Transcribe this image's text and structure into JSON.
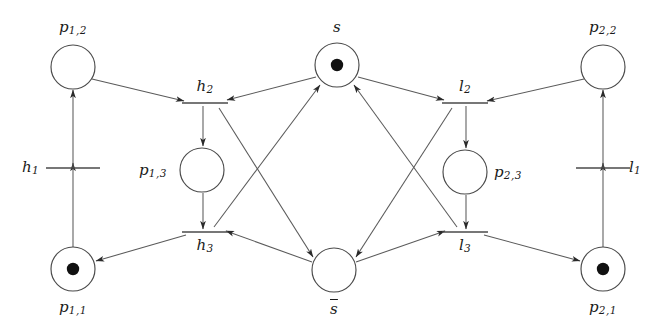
{
  "figure": {
    "kind": "petri-net",
    "width": 656,
    "height": 333,
    "background_color": "#ffffff",
    "stroke_color": "#4a4a4a",
    "arc_color": "#5a5a5a",
    "token_color": "#111111"
  },
  "places": [
    {
      "id": "p12",
      "name": "p",
      "subscript": "1,2",
      "label": "p1,2",
      "cx": 73,
      "cy": 67,
      "r": 22,
      "tokens": 0,
      "label_x": 73,
      "label_y": 20,
      "label_anchor": "center",
      "overline": false
    },
    {
      "id": "p11",
      "name": "p",
      "subscript": "1,1",
      "label": "p1,1",
      "cx": 73,
      "cy": 269,
      "r": 22,
      "tokens": 1,
      "label_x": 73,
      "label_y": 300,
      "label_anchor": "center",
      "overline": false
    },
    {
      "id": "p13",
      "name": "p",
      "subscript": "1,3",
      "label": "p1,3",
      "cx": 202,
      "cy": 170,
      "r": 22,
      "tokens": 0,
      "label_x": 139,
      "label_y": 163,
      "label_anchor": "left",
      "overline": false
    },
    {
      "id": "s",
      "name": "s",
      "subscript": "",
      "label": "s",
      "cx": 337,
      "cy": 65,
      "r": 22,
      "tokens": 1,
      "label_x": 337,
      "label_y": 20,
      "label_anchor": "center",
      "overline": false
    },
    {
      "id": "sbar",
      "name": "s",
      "subscript": "",
      "label": "s-bar",
      "cx": 334,
      "cy": 270,
      "r": 22,
      "tokens": 0,
      "label_x": 334,
      "label_y": 301,
      "label_anchor": "center",
      "overline": true
    },
    {
      "id": "p23",
      "name": "p",
      "subscript": "2,3",
      "label": "p2,3",
      "cx": 465,
      "cy": 172,
      "r": 22,
      "tokens": 0,
      "label_x": 494,
      "label_y": 165,
      "label_anchor": "left",
      "overline": false
    },
    {
      "id": "p22",
      "name": "p",
      "subscript": "2,2",
      "label": "p2,2",
      "cx": 603,
      "cy": 67,
      "r": 22,
      "tokens": 0,
      "label_x": 603,
      "label_y": 20,
      "label_anchor": "center",
      "overline": false
    },
    {
      "id": "p21",
      "name": "p",
      "subscript": "2,1",
      "label": "p2,1",
      "cx": 603,
      "cy": 269,
      "r": 22,
      "tokens": 1,
      "label_x": 603,
      "label_y": 300,
      "label_anchor": "center",
      "overline": false
    }
  ],
  "transitions": [
    {
      "id": "h1",
      "name": "h",
      "subscript": "1",
      "label": "h1",
      "cx": 73,
      "cy": 168,
      "half_width": 27,
      "label_x": 22,
      "label_y": 160,
      "label_anchor": "left"
    },
    {
      "id": "h2",
      "name": "h",
      "subscript": "2",
      "label": "h2",
      "cx": 205,
      "cy": 103,
      "half_width": 23,
      "label_x": 205,
      "label_y": 79,
      "label_anchor": "center"
    },
    {
      "id": "h3",
      "name": "h",
      "subscript": "3",
      "label": "h3",
      "cx": 205,
      "cy": 232,
      "half_width": 23,
      "label_x": 205,
      "label_y": 238,
      "label_anchor": "center"
    },
    {
      "id": "l2",
      "name": "l",
      "subscript": "2",
      "label": "l2",
      "cx": 465,
      "cy": 103,
      "half_width": 23,
      "label_x": 465,
      "label_y": 79,
      "label_anchor": "center"
    },
    {
      "id": "l3",
      "name": "l",
      "subscript": "3",
      "label": "l3",
      "cx": 465,
      "cy": 232,
      "half_width": 23,
      "label_x": 465,
      "label_y": 238,
      "label_anchor": "center"
    },
    {
      "id": "l1",
      "name": "l",
      "subscript": "1",
      "label": "l1",
      "cx": 603,
      "cy": 168,
      "half_width": 27,
      "label_x": 629,
      "label_y": 160,
      "label_anchor": "left"
    }
  ],
  "arcs": [
    {
      "id": "a1",
      "from": "p11",
      "to": "h1",
      "from_label": "p1,1",
      "to_label": "h1",
      "x1": 73,
      "y1": 247,
      "x2": 73,
      "y2": 163
    },
    {
      "id": "a2",
      "from": "h1",
      "to": "p12",
      "from_label": "h1",
      "to_label": "p1,2",
      "x1": 73,
      "y1": 168,
      "x2": 73,
      "y2": 90
    },
    {
      "id": "a3",
      "from": "p12",
      "to": "h2",
      "from_label": "p1,2",
      "to_label": "h2",
      "x1": 92,
      "y1": 79,
      "x2": 184,
      "y2": 101
    },
    {
      "id": "a4",
      "from": "h2",
      "to": "p13",
      "from_label": "h2",
      "to_label": "p1,3",
      "x1": 203,
      "y1": 106,
      "x2": 203,
      "y2": 146
    },
    {
      "id": "a5",
      "from": "p13",
      "to": "h3",
      "from_label": "p1,3",
      "to_label": "h3",
      "x1": 203,
      "y1": 193,
      "x2": 203,
      "y2": 229
    },
    {
      "id": "a6",
      "from": "h3",
      "to": "p11",
      "from_label": "h3",
      "to_label": "p1,1",
      "x1": 186,
      "y1": 235,
      "x2": 96,
      "y2": 261
    },
    {
      "id": "a7",
      "from": "s",
      "to": "h2",
      "from_label": "s",
      "to_label": "h2",
      "x1": 316,
      "y1": 77,
      "x2": 227,
      "y2": 100
    },
    {
      "id": "a8",
      "from": "h2",
      "to": "sbar",
      "from_label": "h2",
      "to_label": "s-bar",
      "x1": 219,
      "y1": 108,
      "x2": 313,
      "y2": 257
    },
    {
      "id": "a9",
      "from": "sbar",
      "to": "h3",
      "from_label": "s-bar",
      "to_label": "h3",
      "x1": 312,
      "y1": 262,
      "x2": 226,
      "y2": 231
    },
    {
      "id": "a10",
      "from": "h3",
      "to": "s",
      "from_label": "h3",
      "to_label": "s",
      "x1": 214,
      "y1": 227,
      "x2": 320,
      "y2": 85
    },
    {
      "id": "a11",
      "from": "p22",
      "to": "l2",
      "from_label": "p2,2",
      "to_label": "l2",
      "x1": 584,
      "y1": 79,
      "x2": 487,
      "y2": 101
    },
    {
      "id": "a12",
      "from": "l2",
      "to": "p23",
      "from_label": "l2",
      "to_label": "p2,3",
      "x1": 466,
      "y1": 106,
      "x2": 466,
      "y2": 148
    },
    {
      "id": "a13",
      "from": "p23",
      "to": "l3",
      "from_label": "p2,3",
      "to_label": "l3",
      "x1": 466,
      "y1": 195,
      "x2": 466,
      "y2": 229
    },
    {
      "id": "a14",
      "from": "l3",
      "to": "p21",
      "from_label": "l3",
      "to_label": "p2,1",
      "x1": 484,
      "y1": 235,
      "x2": 580,
      "y2": 261
    },
    {
      "id": "a15",
      "from": "s",
      "to": "l2",
      "from_label": "s",
      "to_label": "l2",
      "x1": 358,
      "y1": 77,
      "x2": 444,
      "y2": 100
    },
    {
      "id": "a16",
      "from": "l2",
      "to": "sbar",
      "from_label": "l2",
      "to_label": "s-bar",
      "x1": 452,
      "y1": 108,
      "x2": 356,
      "y2": 257
    },
    {
      "id": "a17",
      "from": "sbar",
      "to": "l3",
      "from_label": "s-bar",
      "to_label": "l3",
      "x1": 356,
      "y1": 262,
      "x2": 445,
      "y2": 231
    },
    {
      "id": "a18",
      "from": "l3",
      "to": "s",
      "from_label": "l3",
      "to_label": "s",
      "x1": 457,
      "y1": 227,
      "x2": 354,
      "y2": 85
    },
    {
      "id": "a19",
      "from": "p21",
      "to": "l1",
      "from_label": "p2,1",
      "to_label": "l1",
      "x1": 603,
      "y1": 247,
      "x2": 603,
      "y2": 163
    },
    {
      "id": "a20",
      "from": "l1",
      "to": "p22",
      "from_label": "l1",
      "to_label": "p2,2",
      "x1": 603,
      "y1": 168,
      "x2": 603,
      "y2": 90
    }
  ]
}
